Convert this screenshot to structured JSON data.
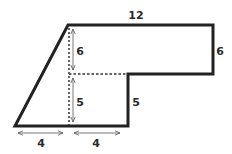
{
  "diagram": {
    "type": "composite-shape-with-dimensions",
    "shape": "trapezoid-plus-rectangle",
    "colors": {
      "stroke": "#222222",
      "dotted": "#333333",
      "arrow": "#555555",
      "label": "#2a2a2a",
      "background": "#ffffff"
    },
    "labels": {
      "top_width": "12",
      "right_height": "6",
      "step_height": "5",
      "inner_upper_height": "6",
      "inner_lower_height": "5",
      "bottom_left_width": "4",
      "bottom_right_width": "4"
    }
  }
}
